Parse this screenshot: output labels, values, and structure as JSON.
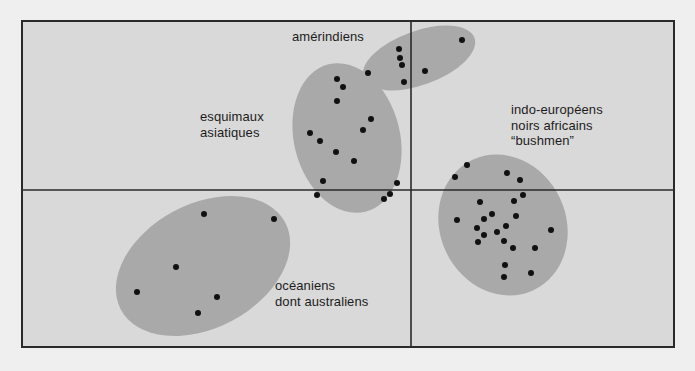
{
  "colors": {
    "page_background": "#efefef",
    "frame_background": "#d9d9d9",
    "cluster_fill": "#a9a9a9",
    "point": "#111111",
    "frame_stroke": "#2a2a2a"
  },
  "frame": {
    "x": 22,
    "y": 21,
    "width": 652,
    "height": 326
  },
  "axes": {
    "vertical_x": 411,
    "horizontal_y": 190
  },
  "clusters": [
    {
      "id": "amerindiens",
      "label_lines": [
        "amérindiens"
      ],
      "label_pos": {
        "x": 292,
        "y": 29
      },
      "ellipse": {
        "cx": 419,
        "cy": 58,
        "rx": 59,
        "ry": 27,
        "rotate": -20
      },
      "points": [
        [
          462,
          40
        ],
        [
          399,
          49
        ],
        [
          400,
          58
        ],
        [
          402,
          65
        ],
        [
          368,
          73
        ],
        [
          425,
          71
        ],
        [
          404,
          82
        ]
      ]
    },
    {
      "id": "esquimaux-asiatiques",
      "label_lines": [
        "esquimaux",
        "asiatiques"
      ],
      "label_pos": {
        "x": 200,
        "y": 109
      },
      "ellipse": {
        "cx": 347,
        "cy": 138,
        "rx": 53,
        "ry": 76,
        "rotate": -14
      },
      "points": [
        [
          337,
          79
        ],
        [
          343,
          87
        ],
        [
          337,
          101
        ],
        [
          371,
          119
        ],
        [
          363,
          130
        ],
        [
          310,
          133
        ],
        [
          320,
          141
        ],
        [
          336,
          152
        ],
        [
          354,
          161
        ],
        [
          323,
          181
        ],
        [
          397,
          183
        ],
        [
          317,
          195
        ],
        [
          390,
          194
        ],
        [
          384,
          199
        ]
      ]
    },
    {
      "id": "indo-europeens-noirs-africains-bushmen",
      "label_lines": [
        "indo-européens",
        "noirs africains",
        "“bushmen”"
      ],
      "label_pos": {
        "x": 511,
        "y": 102
      },
      "ellipse": {
        "cx": 503,
        "cy": 225,
        "rx": 63,
        "ry": 72,
        "rotate": -25
      },
      "points": [
        [
          467,
          165
        ],
        [
          455,
          177
        ],
        [
          507,
          173
        ],
        [
          520,
          180
        ],
        [
          523,
          195
        ],
        [
          480,
          202
        ],
        [
          514,
          201
        ],
        [
          492,
          214
        ],
        [
          484,
          219
        ],
        [
          516,
          216
        ],
        [
          457,
          220
        ],
        [
          477,
          228
        ],
        [
          506,
          226
        ],
        [
          551,
          230
        ],
        [
          484,
          235
        ],
        [
          497,
          232
        ],
        [
          478,
          242
        ],
        [
          504,
          241
        ],
        [
          513,
          248
        ],
        [
          535,
          248
        ],
        [
          505,
          265
        ],
        [
          531,
          273
        ],
        [
          504,
          277
        ]
      ]
    },
    {
      "id": "oceaniens-dont-australiens",
      "label_lines": [
        "océaniens",
        "dont australiens"
      ],
      "label_pos": {
        "x": 275,
        "y": 278
      },
      "ellipse": {
        "cx": 203,
        "cy": 266,
        "rx": 93,
        "ry": 62,
        "rotate": -28
      },
      "points": [
        [
          204,
          214
        ],
        [
          274,
          219
        ],
        [
          176,
          267
        ],
        [
          137,
          292
        ],
        [
          217,
          297
        ],
        [
          198,
          313
        ]
      ]
    }
  ],
  "chart_data": {
    "type": "scatter",
    "title": "",
    "xlabel": "",
    "ylabel": "",
    "grid": false,
    "axes": "two crossing axes dividing the plot into four quadrants, no ticks",
    "series": [
      {
        "name": "amérindiens",
        "points_px": [
          [
            462,
            40
          ],
          [
            399,
            49
          ],
          [
            400,
            58
          ],
          [
            402,
            65
          ],
          [
            368,
            73
          ],
          [
            425,
            71
          ],
          [
            404,
            82
          ]
        ]
      },
      {
        "name": "esquimaux asiatiques",
        "points_px": [
          [
            337,
            79
          ],
          [
            343,
            87
          ],
          [
            337,
            101
          ],
          [
            371,
            119
          ],
          [
            363,
            130
          ],
          [
            310,
            133
          ],
          [
            320,
            141
          ],
          [
            336,
            152
          ],
          [
            354,
            161
          ],
          [
            323,
            181
          ],
          [
            397,
            183
          ],
          [
            317,
            195
          ],
          [
            390,
            194
          ],
          [
            384,
            199
          ]
        ]
      },
      {
        "name": "indo-européens noirs africains “bushmen”",
        "points_px": [
          [
            467,
            165
          ],
          [
            455,
            177
          ],
          [
            507,
            173
          ],
          [
            520,
            180
          ],
          [
            523,
            195
          ],
          [
            480,
            202
          ],
          [
            514,
            201
          ],
          [
            492,
            214
          ],
          [
            484,
            219
          ],
          [
            516,
            216
          ],
          [
            457,
            220
          ],
          [
            477,
            228
          ],
          [
            506,
            226
          ],
          [
            551,
            230
          ],
          [
            484,
            235
          ],
          [
            497,
            232
          ],
          [
            478,
            242
          ],
          [
            504,
            241
          ],
          [
            513,
            248
          ],
          [
            535,
            248
          ],
          [
            505,
            265
          ],
          [
            531,
            273
          ],
          [
            504,
            277
          ]
        ]
      },
      {
        "name": "océaniens dont australiens",
        "points_px": [
          [
            204,
            214
          ],
          [
            274,
            219
          ],
          [
            176,
            267
          ],
          [
            137,
            292
          ],
          [
            217,
            297
          ],
          [
            198,
            313
          ]
        ]
      }
    ]
  }
}
